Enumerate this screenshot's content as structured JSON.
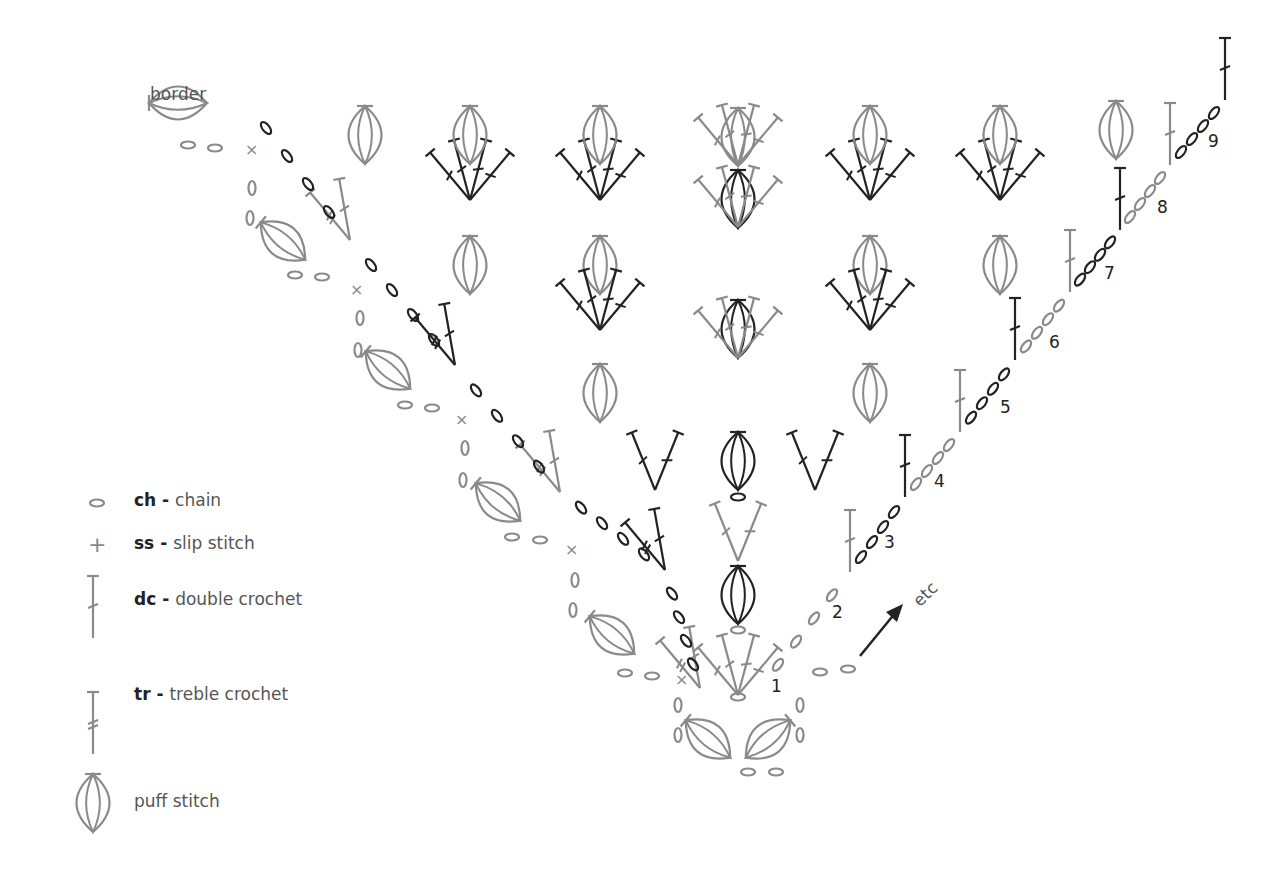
{
  "title_label": "border",
  "etc_label": "etc",
  "row_numbers": [
    "1",
    "2",
    "3",
    "4",
    "5",
    "6",
    "7",
    "8",
    "9"
  ],
  "legend": [
    {
      "abbr": "ch",
      "sep": " - ",
      "name": "chain",
      "icon": "chain-icon"
    },
    {
      "abbr": "ss",
      "sep": " - ",
      "name": "slip stitch",
      "icon": "slip-stitch-icon"
    },
    {
      "abbr": "dc",
      "sep": " - ",
      "name": "double crochet",
      "icon": "double-crochet-icon"
    },
    {
      "abbr": "tr",
      "sep": " - ",
      "name": "treble crochet",
      "icon": "treble-crochet-icon"
    },
    {
      "abbr": "",
      "sep": "",
      "name": "puff stitch",
      "icon": "puff-stitch-icon"
    }
  ],
  "colors": {
    "gray": "#8a8a8a",
    "dark": "#222222"
  }
}
